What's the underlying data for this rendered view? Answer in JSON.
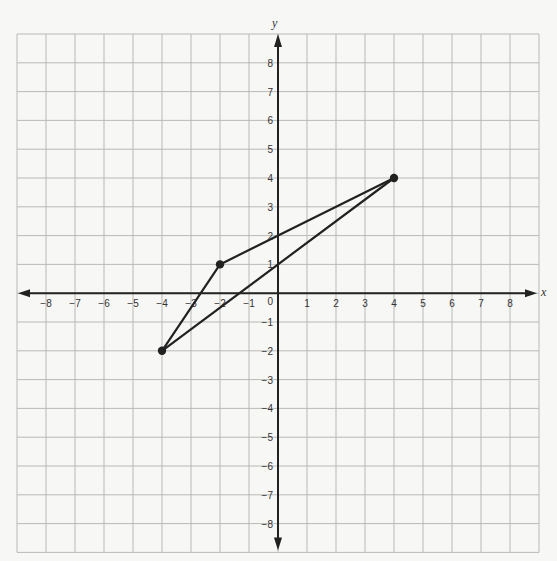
{
  "chart_data": {
    "type": "scatter",
    "title": "",
    "xlabel": "x",
    "ylabel": "y",
    "xlim": [
      -9,
      9
    ],
    "ylim": [
      -9,
      9
    ],
    "grid": true,
    "x_ticks": [
      -8,
      -7,
      -6,
      -5,
      -4,
      -3,
      -2,
      -1,
      1,
      2,
      3,
      4,
      5,
      6,
      7,
      8
    ],
    "y_ticks": [
      -8,
      -7,
      -6,
      -5,
      -4,
      -3,
      -2,
      -1,
      1,
      2,
      3,
      4,
      5,
      6,
      7,
      8
    ],
    "origin_label": "0",
    "points": [
      {
        "x": 4,
        "y": 4
      },
      {
        "x": -2,
        "y": 1
      },
      {
        "x": -4,
        "y": -2
      }
    ],
    "segments": [
      {
        "from": [
          -2,
          1
        ],
        "to": [
          4,
          4
        ]
      },
      {
        "from": [
          -4,
          -2
        ],
        "to": [
          4,
          4
        ]
      },
      {
        "from": [
          -4,
          -2
        ],
        "to": [
          -2,
          1
        ]
      }
    ],
    "shape": "triangle"
  },
  "colors": {
    "grid": "#b9b9b9",
    "axis": "#222222",
    "figure": "#222222",
    "background": "#f7f7f5"
  }
}
